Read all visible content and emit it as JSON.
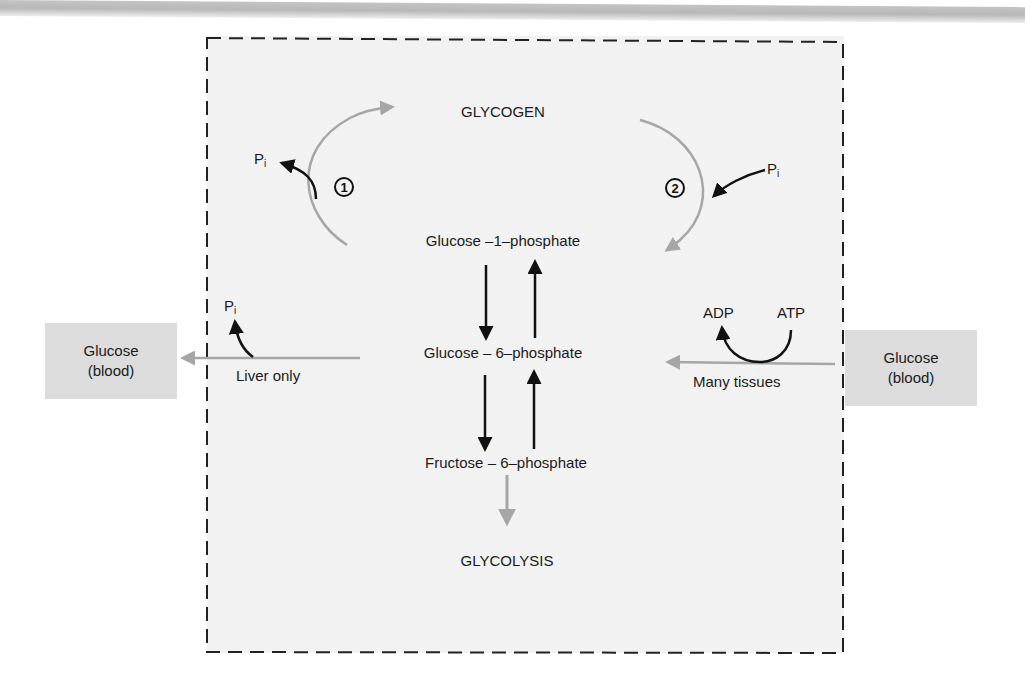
{
  "diagram": {
    "nodes": {
      "glycogen": "GLYCOGEN",
      "g1p": "Glucose –1–phosphate",
      "g6p": "Glucose – 6–phosphate",
      "f6p": "Fructose – 6–phosphate",
      "glycolysis": "GLYCOLYSIS",
      "blood_left_line1": "Glucose",
      "blood_left_line2": "(blood)",
      "blood_right_line1": "Glucose",
      "blood_right_line2": "(blood)"
    },
    "labels": {
      "pi_main": "P",
      "pi_sub": "i",
      "step1": "1",
      "step2": "2",
      "liver_only": "Liver only",
      "many_tissues": "Many tissues",
      "adp": "ADP",
      "atp": "ATP"
    },
    "edges": [
      {
        "from": "glycogen",
        "to": "g1p",
        "step": "2",
        "cofactor_in": "Pi",
        "color": "gray"
      },
      {
        "from": "g1p",
        "to": "glycogen",
        "step": "1",
        "cofactor_out": "Pi",
        "color": "gray"
      },
      {
        "from": "g1p",
        "to": "g6p",
        "color": "black"
      },
      {
        "from": "g6p",
        "to": "g1p",
        "color": "black"
      },
      {
        "from": "g6p",
        "to": "f6p",
        "color": "black"
      },
      {
        "from": "f6p",
        "to": "g6p",
        "color": "black"
      },
      {
        "from": "f6p",
        "to": "glycolysis",
        "color": "gray"
      },
      {
        "from": "g6p",
        "to": "blood_left",
        "label": "Liver only",
        "cofactor_out": "Pi",
        "color": "gray"
      },
      {
        "from": "blood_right",
        "to": "g6p",
        "label": "Many tissues",
        "cofactor_in": "ATP",
        "cofactor_out": "ADP",
        "color": "gray"
      }
    ],
    "colors": {
      "panel_bg": "#f2f2f2",
      "blood_box_bg": "#dcdcdc",
      "gray_arrow": "#a6a6a6",
      "black_arrow": "#111111",
      "dash_border": "#222222"
    }
  }
}
